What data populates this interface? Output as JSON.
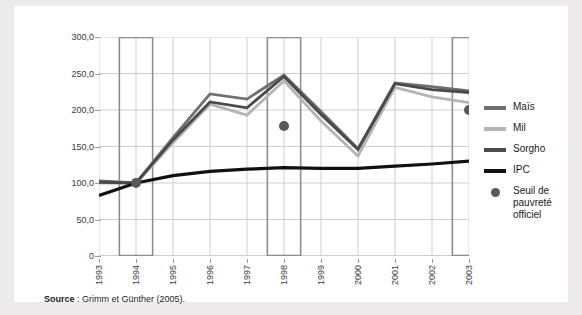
{
  "figure": {
    "background": "#eceaea",
    "card_background": "#ffffff"
  },
  "source": {
    "label": "Source",
    "separator": " : ",
    "text": "Grimm et Günther (2005)."
  },
  "legend": {
    "position": "right",
    "items": [
      {
        "label": "Maïs",
        "color": "#6f6f6f",
        "marker": "line"
      },
      {
        "label": "Mil",
        "color": "#b4b4b4",
        "marker": "line"
      },
      {
        "label": "Sorgho",
        "color": "#4a4a4a",
        "marker": "line"
      },
      {
        "label": "IPC",
        "color": "#111111",
        "marker": "line"
      },
      {
        "label": "Seuil de pauvreté officiel",
        "color": "#585858",
        "marker": "dot"
      }
    ]
  },
  "chart_data": {
    "type": "line",
    "title": "",
    "subtitle": "",
    "xlabel": "",
    "ylabel": "",
    "x": [
      1993,
      1994,
      1995,
      1996,
      1997,
      1998,
      1999,
      2000,
      2001,
      2002,
      2003
    ],
    "categories": [
      "1993",
      "1994",
      "1995",
      "1996",
      "1997",
      "1998",
      "1999",
      "2000",
      "2001",
      "2002",
      "2003"
    ],
    "ylim": [
      0,
      300
    ],
    "yticks": [
      0,
      50,
      100,
      150,
      200,
      250,
      300
    ],
    "ytick_labels": [
      "0",
      "50,0",
      "100,0",
      "150,0",
      "200,0",
      "250,0",
      "300,0"
    ],
    "grid": true,
    "legend_position": "right",
    "series": [
      {
        "name": "Maïs",
        "color": "#6f6f6f",
        "values": [
          103,
          100,
          162,
          222,
          215,
          248,
          198,
          147,
          237,
          232,
          226
        ]
      },
      {
        "name": "Mil",
        "color": "#b4b4b4",
        "values": [
          100,
          100,
          155,
          208,
          193,
          240,
          185,
          137,
          231,
          218,
          210
        ]
      },
      {
        "name": "Sorgho",
        "color": "#4a4a4a",
        "values": [
          101,
          100,
          159,
          211,
          203,
          246,
          194,
          146,
          236,
          228,
          224
        ]
      },
      {
        "name": "IPC",
        "color": "#111111",
        "values": [
          83,
          100,
          110,
          116,
          119,
          121,
          120,
          120,
          123,
          126,
          130
        ]
      }
    ],
    "markers": {
      "name": "Seuil de pauvreté officiel",
      "color": "#585858",
      "points": [
        {
          "x": 1994,
          "y": 100
        },
        {
          "x": 1998,
          "y": 178
        },
        {
          "x": 2003,
          "y": 200
        }
      ]
    },
    "highlight_bands": [
      {
        "label": "1994",
        "from": 1993.55,
        "to": 1994.45,
        "stroke": "#8e8e8e"
      },
      {
        "label": "1998",
        "from": 1997.55,
        "to": 1998.45,
        "stroke": "#8e8e8e"
      },
      {
        "label": "2003",
        "from": 2002.55,
        "to": 2003.45,
        "stroke": "#8e8e8e"
      }
    ]
  }
}
